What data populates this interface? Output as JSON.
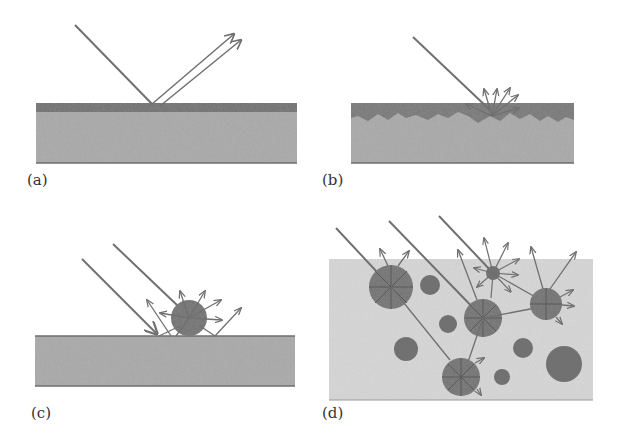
{
  "figure": {
    "colors": {
      "background": "#ffffff",
      "slab_fill": "#a9a9a9",
      "slab_edge": "#6e6e6e",
      "smooth_layer": "#6f6f6f",
      "rough_layer": "#777777",
      "medium_fill": "#d6d6d6",
      "particle_fill": "#717171",
      "ray": "#707070",
      "label": "#333333"
    },
    "panels": [
      {
        "id": "a",
        "label": "(a)",
        "caption": "specular reflection from smooth surface"
      },
      {
        "id": "b",
        "label": "(b)",
        "caption": "diffuse reflection from rough surface"
      },
      {
        "id": "c",
        "label": "(c)",
        "caption": "scattering by particle on surface"
      },
      {
        "id": "d",
        "label": "(d)",
        "caption": "multiple scattering by particles in medium"
      }
    ]
  }
}
